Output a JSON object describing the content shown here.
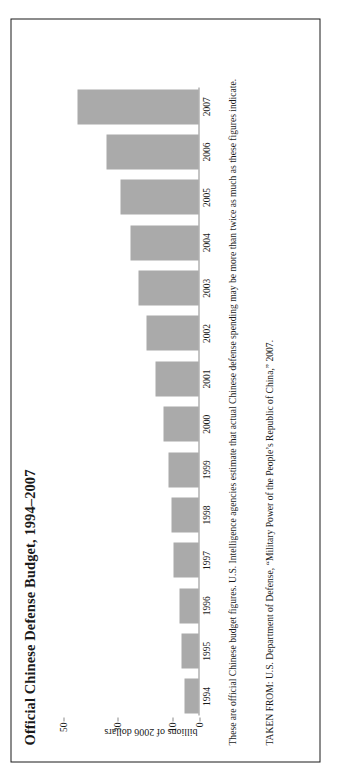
{
  "figure": {
    "title": "Official Chinese Defense Budget, 1994–2007",
    "note": "These are official Chinese budget figures. U.S. Intelligence agencies estimate that actual Chinese defense spending may be more than twice as much as these figures indicate.",
    "source": "TAKEN FROM: U.S. Department of Defense, “Military Power of the People’s Republic of China,” 2007.",
    "bar_color": "#aaaaaa",
    "frame_color": "#1a1a1a",
    "axis_color": "#8a8a8a"
  },
  "chart_data": {
    "type": "bar",
    "title": "Official Chinese Defense Budget, 1994–2007",
    "xlabel": "",
    "ylabel": "billions of 2006 dollars",
    "categories": [
      "1994",
      "1995",
      "1996",
      "1997",
      "1998",
      "1999",
      "2000",
      "2001",
      "2002",
      "2003",
      "2004",
      "2005",
      "2006",
      "2007"
    ],
    "values": [
      5,
      6,
      7,
      9,
      10,
      11,
      13,
      16,
      19,
      22,
      25,
      29,
      34,
      45
    ],
    "ylim": [
      0,
      55
    ],
    "yticks": [
      0,
      10,
      30,
      50
    ],
    "ytick_labels": [
      "0",
      "10",
      "30",
      "50"
    ],
    "grid": false,
    "legend": false
  }
}
